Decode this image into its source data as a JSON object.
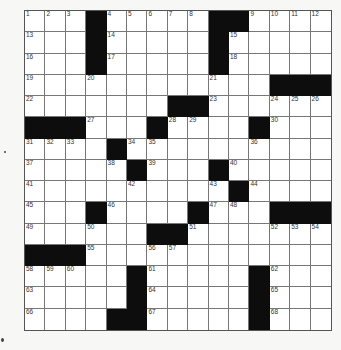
{
  "puzzle": {
    "rows": 15,
    "cols": 15,
    "colors": {
      "block": "#0d0d0d",
      "cell": "#ffffff",
      "line": "#777777",
      "background": "#f7f7f5"
    },
    "blocks": [
      [
        0,
        3
      ],
      [
        0,
        9
      ],
      [
        0,
        10
      ],
      [
        1,
        3
      ],
      [
        1,
        9
      ],
      [
        2,
        3
      ],
      [
        2,
        9
      ],
      [
        3,
        12
      ],
      [
        3,
        13
      ],
      [
        3,
        14
      ],
      [
        4,
        7
      ],
      [
        4,
        8
      ],
      [
        5,
        0
      ],
      [
        5,
        1
      ],
      [
        5,
        2
      ],
      [
        5,
        6
      ],
      [
        5,
        11
      ],
      [
        6,
        4
      ],
      [
        7,
        5
      ],
      [
        7,
        9
      ],
      [
        8,
        10
      ],
      [
        9,
        3
      ],
      [
        9,
        8
      ],
      [
        9,
        12
      ],
      [
        9,
        13
      ],
      [
        9,
        14
      ],
      [
        10,
        6
      ],
      [
        10,
        7
      ],
      [
        11,
        0
      ],
      [
        11,
        1
      ],
      [
        11,
        2
      ],
      [
        12,
        5
      ],
      [
        12,
        11
      ],
      [
        13,
        5
      ],
      [
        13,
        11
      ],
      [
        14,
        4
      ],
      [
        14,
        5
      ],
      [
        14,
        11
      ]
    ],
    "numbers": [
      {
        "r": 0,
        "c": 0,
        "n": "1"
      },
      {
        "r": 0,
        "c": 1,
        "n": "2"
      },
      {
        "r": 0,
        "c": 2,
        "n": "3"
      },
      {
        "r": 0,
        "c": 4,
        "n": "4"
      },
      {
        "r": 0,
        "c": 5,
        "n": "5"
      },
      {
        "r": 0,
        "c": 6,
        "n": "6"
      },
      {
        "r": 0,
        "c": 7,
        "n": "7"
      },
      {
        "r": 0,
        "c": 8,
        "n": "8"
      },
      {
        "r": 0,
        "c": 11,
        "n": "9"
      },
      {
        "r": 0,
        "c": 12,
        "n": "10"
      },
      {
        "r": 0,
        "c": 13,
        "n": "11"
      },
      {
        "r": 0,
        "c": 14,
        "n": "12"
      },
      {
        "r": 1,
        "c": 0,
        "n": "13"
      },
      {
        "r": 1,
        "c": 4,
        "n": "14"
      },
      {
        "r": 1,
        "c": 10,
        "n": "15"
      },
      {
        "r": 2,
        "c": 0,
        "n": "16"
      },
      {
        "r": 2,
        "c": 4,
        "n": "17"
      },
      {
        "r": 2,
        "c": 10,
        "n": "18"
      },
      {
        "r": 3,
        "c": 0,
        "n": "19"
      },
      {
        "r": 3,
        "c": 3,
        "n": "20"
      },
      {
        "r": 3,
        "c": 9,
        "n": "21"
      },
      {
        "r": 4,
        "c": 0,
        "n": "22"
      },
      {
        "r": 4,
        "c": 9,
        "n": "23"
      },
      {
        "r": 4,
        "c": 12,
        "n": "24"
      },
      {
        "r": 4,
        "c": 13,
        "n": "25"
      },
      {
        "r": 4,
        "c": 14,
        "n": "26"
      },
      {
        "r": 5,
        "c": 3,
        "n": "27"
      },
      {
        "r": 5,
        "c": 7,
        "n": "28"
      },
      {
        "r": 5,
        "c": 8,
        "n": "29"
      },
      {
        "r": 5,
        "c": 12,
        "n": "30"
      },
      {
        "r": 6,
        "c": 0,
        "n": "31"
      },
      {
        "r": 6,
        "c": 1,
        "n": "32"
      },
      {
        "r": 6,
        "c": 2,
        "n": "33"
      },
      {
        "r": 6,
        "c": 5,
        "n": "34"
      },
      {
        "r": 6,
        "c": 6,
        "n": "35"
      },
      {
        "r": 6,
        "c": 11,
        "n": "36"
      },
      {
        "r": 7,
        "c": 0,
        "n": "37"
      },
      {
        "r": 7,
        "c": 4,
        "n": "38"
      },
      {
        "r": 7,
        "c": 6,
        "n": "39"
      },
      {
        "r": 7,
        "c": 10,
        "n": "40"
      },
      {
        "r": 8,
        "c": 0,
        "n": "41"
      },
      {
        "r": 8,
        "c": 5,
        "n": "42"
      },
      {
        "r": 8,
        "c": 9,
        "n": "43"
      },
      {
        "r": 8,
        "c": 11,
        "n": "44"
      },
      {
        "r": 9,
        "c": 0,
        "n": "45"
      },
      {
        "r": 9,
        "c": 4,
        "n": "46"
      },
      {
        "r": 9,
        "c": 9,
        "n": "47"
      },
      {
        "r": 9,
        "c": 10,
        "n": "48"
      },
      {
        "r": 10,
        "c": 0,
        "n": "49"
      },
      {
        "r": 10,
        "c": 3,
        "n": "50"
      },
      {
        "r": 10,
        "c": 8,
        "n": "51"
      },
      {
        "r": 10,
        "c": 12,
        "n": "52"
      },
      {
        "r": 10,
        "c": 13,
        "n": "53"
      },
      {
        "r": 10,
        "c": 14,
        "n": "54"
      },
      {
        "r": 11,
        "c": 3,
        "n": "55"
      },
      {
        "r": 11,
        "c": 6,
        "n": "56"
      },
      {
        "r": 11,
        "c": 7,
        "n": "57"
      },
      {
        "r": 12,
        "c": 0,
        "n": "58"
      },
      {
        "r": 12,
        "c": 1,
        "n": "59"
      },
      {
        "r": 12,
        "c": 2,
        "n": "60"
      },
      {
        "r": 12,
        "c": 6,
        "n": "61"
      },
      {
        "r": 12,
        "c": 12,
        "n": "62"
      },
      {
        "r": 13,
        "c": 0,
        "n": "63"
      },
      {
        "r": 13,
        "c": 6,
        "n": "64"
      },
      {
        "r": 13,
        "c": 12,
        "n": "65"
      },
      {
        "r": 14,
        "c": 0,
        "n": "66"
      },
      {
        "r": 14,
        "c": 6,
        "n": "67"
      },
      {
        "r": 14,
        "c": 12,
        "n": "68"
      }
    ]
  }
}
